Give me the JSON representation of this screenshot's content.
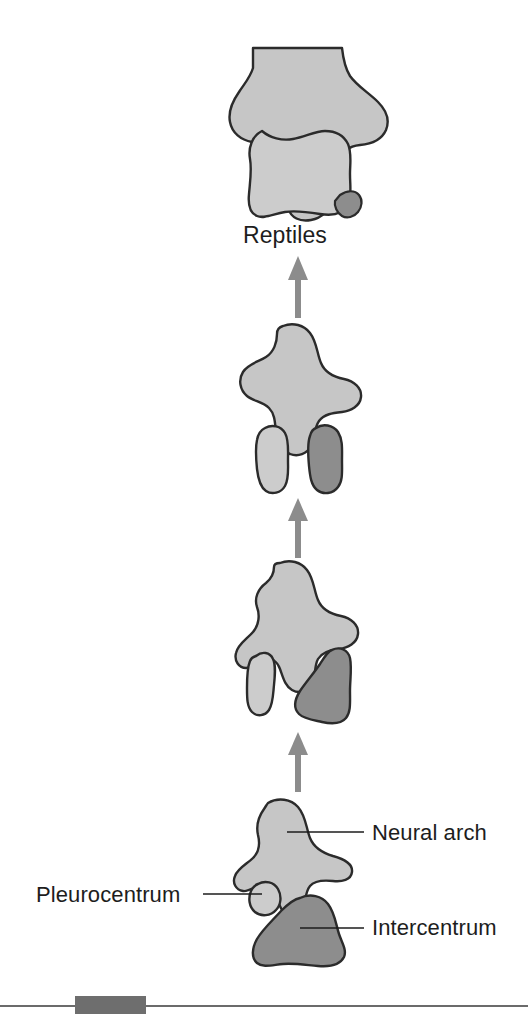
{
  "figure": {
    "title_visible": false,
    "background_color": "#ffffff",
    "stage_labels": [
      {
        "id": "reptiles",
        "text": "Reptiles",
        "x": 243,
        "y": 224
      }
    ],
    "part_labels": [
      {
        "id": "neural-arch",
        "text": "Neural arch",
        "x": 372,
        "y": 822
      },
      {
        "id": "pleurocentrum",
        "text": "Pleurocentrum",
        "x": 36,
        "y": 884
      },
      {
        "id": "intercentrum",
        "text": "Intercentrum",
        "x": 372,
        "y": 917
      }
    ],
    "colors": {
      "neural_arch_fill": "#c6c6c6",
      "pleurocentrum_fill": "#cccccc",
      "intercentrum_fill": "#8d8d8d",
      "outline": "#2b2b2b",
      "arrow": "#8c8c8c",
      "leader_line": "#1d1d1d",
      "rule_line": "#3a3a3a",
      "rule_block": "#6e6e6e"
    },
    "arrows": [
      {
        "id": "arrow-3-to-4",
        "from_stage": 2,
        "to_stage": 1,
        "x": 298,
        "y_top": 258,
        "y_bottom": 318
      },
      {
        "id": "arrow-2-to-3",
        "from_stage": 3,
        "to_stage": 2,
        "x": 298,
        "y_top": 498,
        "y_bottom": 558
      },
      {
        "id": "arrow-1-to-2",
        "from_stage": 4,
        "to_stage": 3,
        "x": 298,
        "y_top": 732,
        "y_bottom": 792
      }
    ],
    "vertebrae": [
      {
        "id": "vertebra-reptiles",
        "stage": "Reptiles",
        "order": 1,
        "elements": [
          "neural arch",
          "pleurocentrum",
          "intercentrum"
        ],
        "pleurocentrum_size": "large",
        "intercentrum_size": "vestigial"
      },
      {
        "id": "vertebra-stage-3",
        "stage": "",
        "order": 2,
        "elements": [
          "neural arch",
          "pleurocentrum",
          "intercentrum"
        ],
        "pleurocentrum_size": "medium",
        "intercentrum_size": "medium"
      },
      {
        "id": "vertebra-stage-2",
        "stage": "",
        "order": 3,
        "elements": [
          "neural arch",
          "pleurocentrum",
          "intercentrum"
        ],
        "pleurocentrum_size": "small",
        "intercentrum_size": "large"
      },
      {
        "id": "vertebra-stage-1",
        "stage": "",
        "order": 4,
        "elements": [
          "neural arch",
          "pleurocentrum",
          "intercentrum"
        ],
        "pleurocentrum_size": "very small",
        "intercentrum_size": "large"
      }
    ],
    "footer_rule": {
      "y": 1006,
      "block_x": 75,
      "block_width": 71,
      "block_height": 18
    }
  }
}
